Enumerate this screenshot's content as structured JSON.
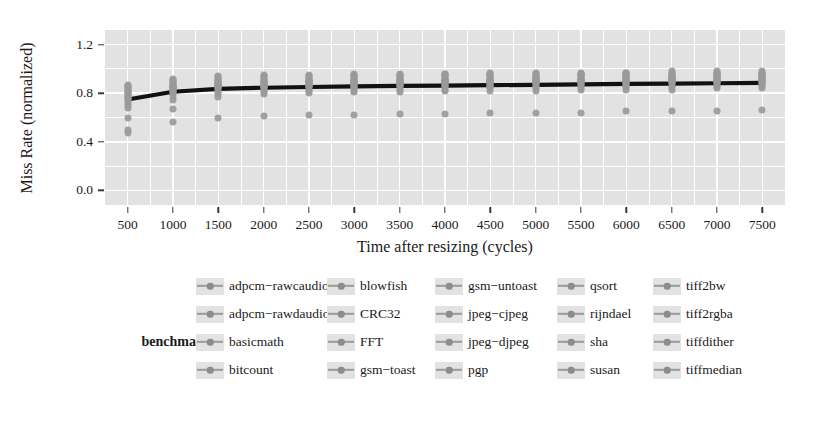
{
  "chart_data": {
    "type": "scatter",
    "title": "",
    "xlabel": "Time after resizing (cycles)",
    "ylabel": "Miss Rate (normalized)",
    "xlim": [
      250,
      7750
    ],
    "ylim": [
      -0.12,
      1.32
    ],
    "xticks": [
      500,
      1000,
      1500,
      2000,
      2500,
      3000,
      3500,
      4000,
      4500,
      5000,
      5500,
      6000,
      6500,
      7000,
      7500
    ],
    "yticks": [
      0.0,
      0.4,
      0.8,
      1.2
    ],
    "ytick_labels": [
      "0.0",
      "0.4",
      "0.8",
      "1.2"
    ],
    "grid": true,
    "legend_position": "bottom",
    "legend_title": "benchmark",
    "x": [
      500,
      1000,
      1500,
      2000,
      2500,
      3000,
      3500,
      4000,
      4500,
      5000,
      5500,
      6000,
      6500,
      7000,
      7500
    ],
    "trend_line": {
      "name": "mean miss rate",
      "color": "#111111",
      "values": [
        0.748,
        0.812,
        0.836,
        0.845,
        0.851,
        0.856,
        0.86,
        0.863,
        0.866,
        0.869,
        0.872,
        0.876,
        0.879,
        0.882,
        0.885
      ]
    },
    "series": [
      {
        "name": "adpcm-rawcaudio",
        "color": "#9a9a9a",
        "values": [
          0.47,
          0.56,
          0.6,
          0.61,
          0.62,
          0.62,
          0.63,
          0.63,
          0.64,
          0.64,
          0.64,
          0.65,
          0.65,
          0.65,
          0.66
        ]
      },
      {
        "name": "adpcm-rawdaudio",
        "color": "#9a9a9a",
        "values": [
          0.5,
          0.67,
          0.77,
          0.79,
          0.8,
          0.81,
          0.81,
          0.82,
          0.82,
          0.82,
          0.83,
          0.83,
          0.83,
          0.84,
          0.84
        ]
      },
      {
        "name": "basicmath",
        "color": "#9a9a9a",
        "values": [
          0.6,
          0.74,
          0.79,
          0.81,
          0.82,
          0.82,
          0.83,
          0.83,
          0.84,
          0.84,
          0.84,
          0.85,
          0.85,
          0.85,
          0.86
        ]
      },
      {
        "name": "bitcount",
        "color": "#9a9a9a",
        "values": [
          0.68,
          0.78,
          0.81,
          0.83,
          0.83,
          0.84,
          0.84,
          0.85,
          0.85,
          0.85,
          0.86,
          0.86,
          0.86,
          0.87,
          0.87
        ]
      },
      {
        "name": "blowfish",
        "color": "#9a9a9a",
        "values": [
          0.7,
          0.8,
          0.83,
          0.84,
          0.85,
          0.85,
          0.86,
          0.86,
          0.86,
          0.87,
          0.87,
          0.87,
          0.88,
          0.88,
          0.88
        ]
      },
      {
        "name": "CRC32",
        "color": "#9a9a9a",
        "values": [
          0.72,
          0.81,
          0.84,
          0.85,
          0.86,
          0.86,
          0.87,
          0.87,
          0.87,
          0.88,
          0.88,
          0.88,
          0.89,
          0.89,
          0.89
        ]
      },
      {
        "name": "FFT",
        "color": "#9a9a9a",
        "values": [
          0.74,
          0.82,
          0.85,
          0.86,
          0.86,
          0.87,
          0.87,
          0.88,
          0.88,
          0.88,
          0.89,
          0.89,
          0.89,
          0.9,
          0.9
        ]
      },
      {
        "name": "gsm-toast",
        "color": "#9a9a9a",
        "values": [
          0.75,
          0.83,
          0.85,
          0.86,
          0.87,
          0.87,
          0.88,
          0.88,
          0.88,
          0.89,
          0.89,
          0.89,
          0.9,
          0.9,
          0.9
        ]
      },
      {
        "name": "gsm-untoast",
        "color": "#9a9a9a",
        "values": [
          0.76,
          0.84,
          0.86,
          0.87,
          0.87,
          0.88,
          0.88,
          0.89,
          0.89,
          0.89,
          0.9,
          0.9,
          0.9,
          0.91,
          0.91
        ]
      },
      {
        "name": "jpeg-cjpeg",
        "color": "#9a9a9a",
        "values": [
          0.77,
          0.84,
          0.86,
          0.87,
          0.88,
          0.88,
          0.89,
          0.89,
          0.89,
          0.9,
          0.9,
          0.9,
          0.91,
          0.91,
          0.91
        ]
      },
      {
        "name": "jpeg-djpeg",
        "color": "#9a9a9a",
        "values": [
          0.78,
          0.85,
          0.87,
          0.88,
          0.88,
          0.89,
          0.89,
          0.9,
          0.9,
          0.9,
          0.91,
          0.91,
          0.91,
          0.92,
          0.92
        ]
      },
      {
        "name": "pgp",
        "color": "#9a9a9a",
        "values": [
          0.79,
          0.85,
          0.87,
          0.88,
          0.89,
          0.89,
          0.9,
          0.9,
          0.9,
          0.91,
          0.91,
          0.91,
          0.92,
          0.92,
          0.92
        ]
      },
      {
        "name": "qsort",
        "color": "#9a9a9a",
        "values": [
          0.8,
          0.86,
          0.88,
          0.89,
          0.89,
          0.9,
          0.9,
          0.91,
          0.91,
          0.91,
          0.92,
          0.92,
          0.92,
          0.93,
          0.93
        ]
      },
      {
        "name": "rijndael",
        "color": "#9a9a9a",
        "values": [
          0.81,
          0.86,
          0.88,
          0.89,
          0.9,
          0.9,
          0.91,
          0.91,
          0.91,
          0.92,
          0.92,
          0.92,
          0.93,
          0.93,
          0.93
        ]
      },
      {
        "name": "sha",
        "color": "#9a9a9a",
        "values": [
          0.82,
          0.87,
          0.89,
          0.9,
          0.9,
          0.91,
          0.91,
          0.92,
          0.92,
          0.92,
          0.93,
          0.93,
          0.93,
          0.94,
          0.94
        ]
      },
      {
        "name": "susan",
        "color": "#9a9a9a",
        "values": [
          0.83,
          0.88,
          0.9,
          0.91,
          0.91,
          0.92,
          0.92,
          0.93,
          0.93,
          0.93,
          0.94,
          0.94,
          0.94,
          0.95,
          0.95
        ]
      },
      {
        "name": "tiff2bw",
        "color": "#9a9a9a",
        "values": [
          0.84,
          0.89,
          0.91,
          0.92,
          0.92,
          0.93,
          0.93,
          0.94,
          0.94,
          0.94,
          0.95,
          0.95,
          0.95,
          0.96,
          0.96
        ]
      },
      {
        "name": "tiff2rgba",
        "color": "#9a9a9a",
        "values": [
          0.85,
          0.9,
          0.92,
          0.93,
          0.93,
          0.94,
          0.94,
          0.95,
          0.95,
          0.95,
          0.96,
          0.96,
          0.96,
          0.96,
          0.96
        ]
      },
      {
        "name": "tiffdither",
        "color": "#9a9a9a",
        "values": [
          0.86,
          0.91,
          0.93,
          0.94,
          0.94,
          0.95,
          0.95,
          0.96,
          0.96,
          0.96,
          0.96,
          0.97,
          0.97,
          0.97,
          0.97
        ]
      },
      {
        "name": "tiffmedian",
        "color": "#9a9a9a",
        "values": [
          0.87,
          0.92,
          0.94,
          0.95,
          0.95,
          0.96,
          0.96,
          0.96,
          0.97,
          0.97,
          0.97,
          0.97,
          0.98,
          0.98,
          0.98
        ]
      }
    ]
  },
  "legend": {
    "title": "benchmark",
    "columns": [
      [
        "adpcm−rawcaudio",
        "adpcm−rawdaudio",
        "basicmath",
        "bitcount"
      ],
      [
        "blowfish",
        "CRC32",
        "FFT",
        "gsm−toast"
      ],
      [
        "gsm−untoast",
        "jpeg−cjpeg",
        "jpeg−djpeg",
        "pgp"
      ],
      [
        "qsort",
        "rijndael",
        "sha",
        "susan"
      ],
      [
        "tiff2bw",
        "tiff2rgba",
        "tiffdither",
        "tiffmedian"
      ]
    ]
  },
  "colors": {
    "panel_background": "#e2e2e2",
    "gridline": "#ffffff",
    "point": "#9a9a9a",
    "trend": "#111111",
    "text": "#1a1a1a"
  }
}
